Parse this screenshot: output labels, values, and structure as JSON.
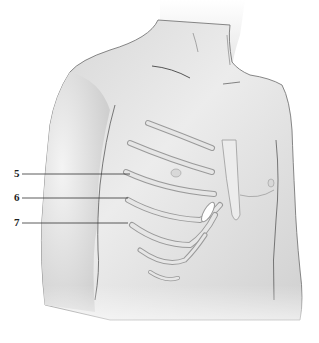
{
  "figure": {
    "colors": {
      "skin_light": "#f2f2f2",
      "skin_mid": "#dcdcdc",
      "skin_shadow": "#c4c4c4",
      "outline": "#6a6a6a",
      "rib": "#e6e6e6",
      "rib_edge": "#9a9a9a",
      "leader_line": "#333333",
      "background": "#ffffff"
    }
  },
  "labels": [
    {
      "text": "5",
      "x": 16,
      "y": 172,
      "target": "rib-5"
    },
    {
      "text": "6",
      "x": 16,
      "y": 197,
      "target": "rib-6"
    },
    {
      "text": "7",
      "x": 16,
      "y": 221,
      "target": "rib-7"
    }
  ]
}
